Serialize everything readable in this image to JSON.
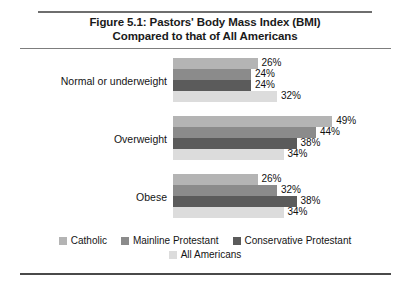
{
  "figure": {
    "title_line_1": "Figure 5.1: Pastors' Body Mass Index (BMI)",
    "title_line_2": "Compared to that of All Americans"
  },
  "chart_data": {
    "type": "bar",
    "orientation": "horizontal",
    "title": "Figure 5.1: Pastors' Body Mass Index (BMI) Compared to that of All Americans",
    "xlabel": "",
    "ylabel": "",
    "grid": false,
    "legend_position": "bottom",
    "xlim": [
      0,
      49
    ],
    "categories": [
      "Normal or underweight",
      "Overweight",
      "Obese"
    ],
    "series": [
      {
        "name": "Catholic",
        "color": "#b4b4b4",
        "values": [
          26,
          49,
          26
        ],
        "labels": [
          "26%",
          "49%",
          "26%"
        ]
      },
      {
        "name": "Mainline Protestant",
        "color": "#8b8b8b",
        "values": [
          24,
          44,
          32
        ],
        "labels": [
          "24%",
          "44%",
          "32%"
        ]
      },
      {
        "name": "Conservative Protestant",
        "color": "#5b5b5b",
        "values": [
          24,
          38,
          38
        ],
        "labels": [
          "24%",
          "38%",
          "38%"
        ]
      },
      {
        "name": "All Americans",
        "color": "#dcdcdc",
        "values": [
          32,
          34,
          34
        ],
        "labels": [
          "32%",
          "34%",
          "34%"
        ]
      }
    ]
  }
}
